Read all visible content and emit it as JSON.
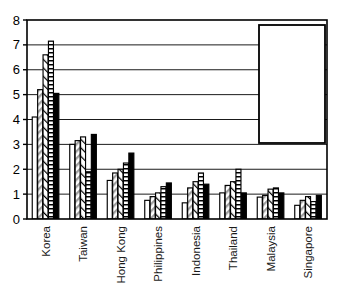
{
  "chart_data": {
    "type": "bar",
    "title": "",
    "subtitle": "",
    "xlabel": "",
    "ylabel": "",
    "ylim": [
      0,
      8
    ],
    "ytick_values": [
      0,
      1,
      2,
      3,
      4,
      5,
      6,
      7,
      8
    ],
    "ytick_labels": [
      "0",
      "1",
      "2",
      "3",
      "4",
      "5",
      "6",
      "7",
      "8"
    ],
    "grid": true,
    "grid_axis": "y",
    "legend_position": "top-right",
    "categories": [
      "Korea",
      "Taiwan",
      "Hong Kong",
      "Philippines",
      "Indonesia",
      "Thailand",
      "Malaysia",
      "Singapore"
    ],
    "series": [
      {
        "name": "1993",
        "fill": "white",
        "values": [
          4.1,
          3.0,
          1.55,
          0.75,
          0.65,
          1.05,
          0.88,
          0.55
        ]
      },
      {
        "name": "1994",
        "fill": "gray-diagonal",
        "values": [
          5.2,
          3.15,
          1.85,
          0.9,
          1.25,
          1.35,
          0.95,
          0.75
        ]
      },
      {
        "name": "1995",
        "fill": "white-diagonal",
        "values": [
          6.6,
          3.3,
          2.0,
          1.05,
          1.5,
          1.5,
          1.2,
          0.9
        ]
      },
      {
        "name": "1996",
        "fill": "horizontal-lines",
        "values": [
          7.15,
          1.9,
          2.25,
          1.3,
          1.85,
          2.0,
          1.25,
          0.7
        ]
      },
      {
        "name": "1997",
        "fill": "solid-black",
        "values": [
          5.05,
          3.4,
          2.65,
          1.45,
          1.4,
          1.05,
          1.05,
          0.95
        ]
      }
    ]
  },
  "legend": {
    "entries": [
      {
        "label": "1993",
        "swatch": "swatch-white"
      },
      {
        "label": "1994",
        "swatch": "swatch-gray-diagonal"
      },
      {
        "label": "1995",
        "swatch": "swatch-white-diagonal"
      },
      {
        "label": "1996",
        "swatch": "swatch-horizontal-lines"
      },
      {
        "label": "1997",
        "swatch": "swatch-solid-black"
      }
    ]
  },
  "colors": {
    "axis": "#000000",
    "grid": "#000000",
    "background": "#ffffff",
    "bar_outline": "#000000",
    "series_1997": "#000000",
    "series_1994_hatch": "#9a9a9a"
  }
}
